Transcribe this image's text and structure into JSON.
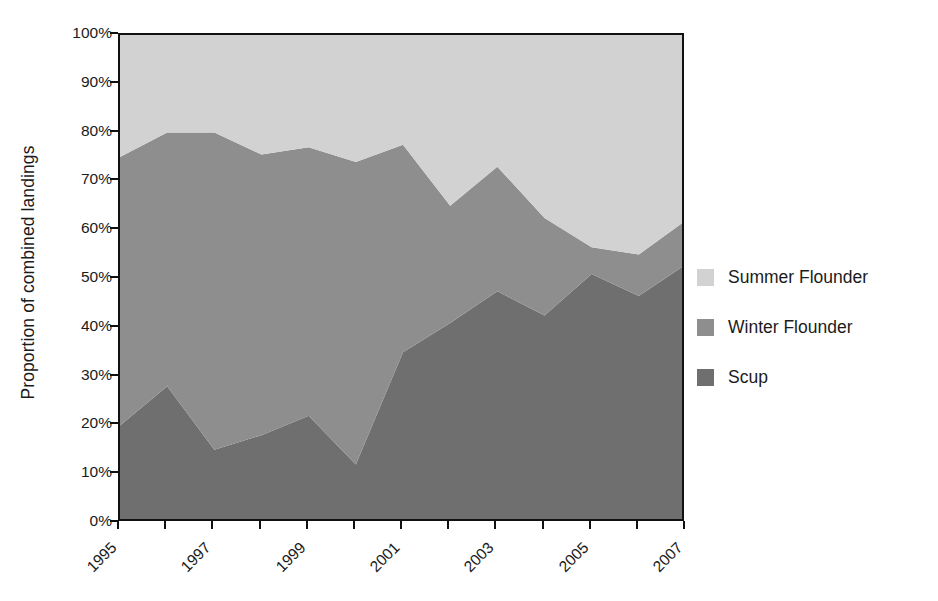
{
  "chart_data": {
    "type": "area",
    "stacked": true,
    "normalized": true,
    "title": "",
    "subtitle": "",
    "xlabel": "",
    "ylabel": "Proportion of combined landings",
    "x": [
      1995,
      1996,
      1997,
      1998,
      1999,
      2000,
      2001,
      2002,
      2003,
      2004,
      2005,
      2006,
      2007
    ],
    "x_tick_labels": [
      "1995",
      "",
      "1997",
      "",
      "1999",
      "",
      "2001",
      "",
      "2003",
      "",
      "2005",
      "",
      "2007"
    ],
    "xlim": [
      1995,
      2007
    ],
    "ylim": [
      0,
      100
    ],
    "y_ticks": [
      0,
      10,
      20,
      30,
      40,
      50,
      60,
      70,
      80,
      90,
      100
    ],
    "y_tick_labels": [
      "0%",
      "10%",
      "20%",
      "30%",
      "40%",
      "50%",
      "60%",
      "70%",
      "80%",
      "90%",
      "100%"
    ],
    "grid": false,
    "legend_position": "right",
    "stack_order_bottom_to_top": [
      "Scup",
      "Winter Flounder",
      "Summer Flounder"
    ],
    "series": [
      {
        "name": "Scup",
        "color": "#6f6f6f",
        "values": [
          20,
          28,
          15,
          18,
          22,
          12,
          35,
          41,
          47.5,
          42.5,
          51,
          46.5,
          53
        ]
      },
      {
        "name": "Winter Flounder",
        "color": "#8e8e8e",
        "values": [
          55,
          52,
          65,
          57.5,
          55,
          62,
          42.5,
          24,
          25.5,
          20,
          5.5,
          8.5,
          9
        ]
      },
      {
        "name": "Summer Flounder",
        "color": "#d2d2d2",
        "values": [
          25,
          20,
          20,
          24.5,
          23,
          26,
          22.5,
          35,
          27,
          37.5,
          43.5,
          45,
          38
        ]
      }
    ],
    "cumulative_boundaries": {
      "scup_top": [
        20,
        28,
        15,
        18,
        22,
        12,
        35,
        41,
        47.5,
        42.5,
        51,
        46.5,
        53
      ],
      "winter_flounder_top": [
        75,
        80,
        80,
        75.5,
        77,
        74,
        77.5,
        65,
        73,
        62.5,
        56.5,
        55,
        62
      ],
      "summer_flounder_top": [
        100,
        100,
        100,
        100,
        100,
        100,
        100,
        100,
        100,
        100,
        100,
        100,
        100
      ]
    }
  },
  "axes": {
    "y_title": "Proportion of combined landings",
    "y_tick_labels": [
      "100%",
      "90%",
      "80%",
      "70%",
      "60%",
      "50%",
      "40%",
      "30%",
      "20%",
      "10%",
      "0%"
    ],
    "x_tick_labels": [
      "1995",
      "1997",
      "1999",
      "2001",
      "2003",
      "2005",
      "2007"
    ]
  },
  "legend": {
    "items": [
      {
        "label": "Summer Flounder",
        "color": "#d2d2d2"
      },
      {
        "label": "Winter Flounder",
        "color": "#8e8e8e"
      },
      {
        "label": "Scup",
        "color": "#6f6f6f"
      }
    ]
  },
  "colors": {
    "summer_flounder": "#d2d2d2",
    "winter_flounder": "#8e8e8e",
    "scup": "#6f6f6f",
    "axis": "#111111",
    "text": "#1b1b1b"
  }
}
